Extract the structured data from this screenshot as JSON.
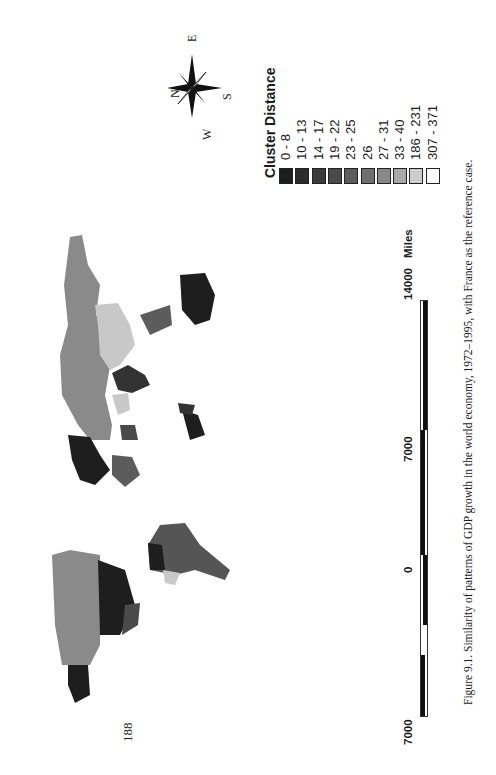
{
  "page": {
    "number": "188"
  },
  "figure": {
    "caption": "Figure 9.1.   Similarity of patterns of GDP growth in the world economy, 1972–1995, with France as the reference case."
  },
  "legend": {
    "title": "Cluster Distance",
    "classes": [
      {
        "label": "0 - 8",
        "color": "#1e1e1e"
      },
      {
        "label": "10 - 13",
        "color": "#2c2c2c"
      },
      {
        "label": "14 - 17",
        "color": "#3a3a3a"
      },
      {
        "label": "19 - 22",
        "color": "#4a4a4a"
      },
      {
        "label": "23 - 25",
        "color": "#5c5c5c"
      },
      {
        "label": "26",
        "color": "#707070"
      },
      {
        "label": "27 - 31",
        "color": "#888888"
      },
      {
        "label": "33 - 40",
        "color": "#a8a8a8"
      },
      {
        "label": "186 - 231",
        "color": "#cfcfcf"
      },
      {
        "label": "307 - 371",
        "color": "#ffffff"
      }
    ]
  },
  "compass": {
    "n": "N",
    "e": "E",
    "s": "S",
    "w": "W"
  },
  "scalebar": {
    "ticks": [
      "7000",
      "0",
      "7000",
      "14000"
    ],
    "unit": "Miles"
  },
  "map": {
    "description": "World choropleth map (rotated) of GDP growth pattern similarity"
  }
}
